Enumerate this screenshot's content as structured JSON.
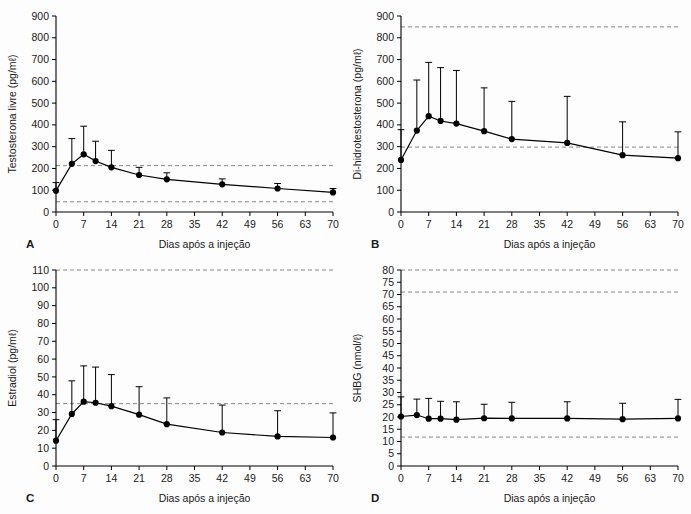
{
  "figure": {
    "background_color": "#fdfdfd",
    "axis_color": "#000000",
    "refline_color": "#7a7a7a",
    "marker_color": "#000000"
  },
  "shared": {
    "xlabel": "Dias após a injeção",
    "xticks": [
      0,
      7,
      14,
      21,
      28,
      35,
      42,
      49,
      56,
      63,
      70
    ],
    "xlim": [
      0,
      70
    ]
  },
  "panels": {
    "a": {
      "letter": "A"
    },
    "b": {
      "letter": "B"
    },
    "c": {
      "letter": "C"
    },
    "d": {
      "letter": "D"
    }
  },
  "chart_data": [
    {
      "panel": "A",
      "type": "line",
      "title": "",
      "xlabel": "Dias após a injeção",
      "ylabel": "Testosterona livre (pg/mℓ)",
      "xlim": [
        0,
        70
      ],
      "ylim": [
        0,
        900
      ],
      "xticks": [
        0,
        7,
        14,
        21,
        28,
        35,
        42,
        49,
        56,
        63,
        70
      ],
      "yticks": [
        0,
        100,
        200,
        300,
        400,
        500,
        600,
        700,
        800,
        900
      ],
      "grid": false,
      "legend": null,
      "reference_lines": [
        213,
        47
      ],
      "x": [
        0,
        4,
        7,
        10,
        14,
        21,
        28,
        42,
        56,
        70
      ],
      "values": [
        98,
        221,
        265,
        234,
        205,
        170,
        150,
        127,
        108,
        90
      ],
      "error_upper": [
        135,
        337,
        394,
        325,
        283,
        205,
        180,
        152,
        131,
        108
      ],
      "error_direction": "up"
    },
    {
      "panel": "B",
      "type": "line",
      "title": "",
      "xlabel": "Dias após a injeção",
      "ylabel": "Di-hidrotestosterona (pg/mℓ)",
      "xlim": [
        0,
        70
      ],
      "ylim": [
        0,
        900
      ],
      "xticks": [
        0,
        7,
        14,
        21,
        28,
        35,
        42,
        49,
        56,
        63,
        70
      ],
      "yticks": [
        0,
        100,
        200,
        300,
        400,
        500,
        600,
        700,
        800,
        900
      ],
      "grid": false,
      "legend": null,
      "reference_lines": [
        850,
        298
      ],
      "x": [
        0,
        4,
        7,
        10,
        14,
        21,
        28,
        42,
        56,
        70
      ],
      "values": [
        239,
        374,
        440,
        418,
        406,
        371,
        335,
        317,
        261,
        247
      ],
      "error_upper": [
        378,
        606,
        687,
        663,
        650,
        570,
        508,
        531,
        414,
        368
      ],
      "error_direction": "up"
    },
    {
      "panel": "C",
      "type": "line",
      "title": "",
      "xlabel": "Dias após a injeção",
      "ylabel": "Estradiol (pg/mℓ)",
      "xlim": [
        0,
        70
      ],
      "ylim": [
        0,
        110
      ],
      "xticks": [
        0,
        7,
        14,
        21,
        28,
        35,
        42,
        49,
        56,
        63,
        70
      ],
      "yticks": [
        0,
        10,
        20,
        30,
        40,
        50,
        60,
        70,
        80,
        90,
        100,
        110
      ],
      "grid": false,
      "legend": null,
      "reference_lines": [
        110,
        35
      ],
      "x": [
        0,
        4,
        7,
        10,
        14,
        21,
        28,
        42,
        56,
        70
      ],
      "values": [
        14.2,
        29.2,
        36.1,
        35.5,
        33.6,
        28.8,
        23.5,
        18.8,
        16.6,
        16.0
      ],
      "error_upper": [
        26.0,
        47.8,
        56.2,
        55.5,
        51.3,
        44.5,
        38.2,
        34.2,
        31.0,
        29.8
      ],
      "error_direction": "up"
    },
    {
      "panel": "D",
      "type": "line",
      "title": "",
      "xlabel": "Dias após a injeção",
      "ylabel": "SHBG (nmol/ℓ)",
      "xlim": [
        0,
        70
      ],
      "ylim": [
        0,
        80
      ],
      "xticks": [
        0,
        7,
        14,
        21,
        28,
        35,
        42,
        49,
        56,
        63,
        70
      ],
      "yticks": [
        0,
        5,
        10,
        15,
        20,
        25,
        30,
        35,
        40,
        45,
        50,
        55,
        60,
        65,
        70,
        75,
        80
      ],
      "grid": false,
      "legend": null,
      "reference_lines": [
        80,
        71,
        11.8
      ],
      "x": [
        0,
        4,
        7,
        10,
        14,
        21,
        28,
        42,
        56,
        70
      ],
      "values": [
        20.2,
        20.8,
        19.3,
        19.3,
        18.9,
        19.5,
        19.4,
        19.4,
        19.1,
        19.4
      ],
      "error_upper": [
        28.2,
        27.3,
        27.6,
        26.4,
        26.2,
        25.2,
        26.0,
        26.2,
        25.6,
        27.2
      ],
      "error_direction": "up"
    }
  ]
}
